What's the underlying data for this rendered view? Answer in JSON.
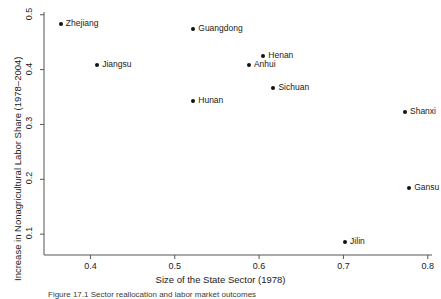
{
  "chart_data": {
    "type": "scatter",
    "title": "",
    "xlabel": "Size of the State Sector (1978)",
    "ylabel": "Increase in Nonagricultural Labor Share (1978–2004)",
    "xlim": [
      0.345,
      0.805
    ],
    "ylim": [
      0.062,
      0.505
    ],
    "xticks": [
      "0.4",
      "0.5",
      "0.6",
      "0.7",
      "0.8"
    ],
    "xtick_values": [
      0.4,
      0.5,
      0.6,
      0.7,
      0.8
    ],
    "yticks": [
      "0.5",
      "0.4",
      "0.3",
      "0.2",
      "0.1"
    ],
    "ytick_values": [
      0.5,
      0.4,
      0.3,
      0.2,
      0.1
    ],
    "grid": false,
    "legend": "none",
    "points": [
      {
        "label": "Zhejiang",
        "x": 0.365,
        "y": 0.483,
        "label_side": "right"
      },
      {
        "label": "Jiangsu",
        "x": 0.408,
        "y": 0.408,
        "label_side": "right"
      },
      {
        "label": "Guangdong",
        "x": 0.522,
        "y": 0.474,
        "label_side": "right"
      },
      {
        "label": "Henan",
        "x": 0.605,
        "y": 0.425,
        "label_side": "right"
      },
      {
        "label": "Anhui",
        "x": 0.588,
        "y": 0.408,
        "label_side": "right"
      },
      {
        "label": "Sichuan",
        "x": 0.617,
        "y": 0.367,
        "label_side": "right"
      },
      {
        "label": "Hunan",
        "x": 0.522,
        "y": 0.343,
        "label_side": "right"
      },
      {
        "label": "Shanxi",
        "x": 0.773,
        "y": 0.323,
        "label_side": "right"
      },
      {
        "label": "Gansu",
        "x": 0.778,
        "y": 0.185,
        "label_side": "right"
      },
      {
        "label": "Jilin",
        "x": 0.702,
        "y": 0.085,
        "label_side": "right"
      }
    ],
    "marker_color": "#111111",
    "axis_color": "#555555"
  },
  "caption": {
    "text": "Figure 17.1 Sector reallocation and labor market outcomes"
  }
}
